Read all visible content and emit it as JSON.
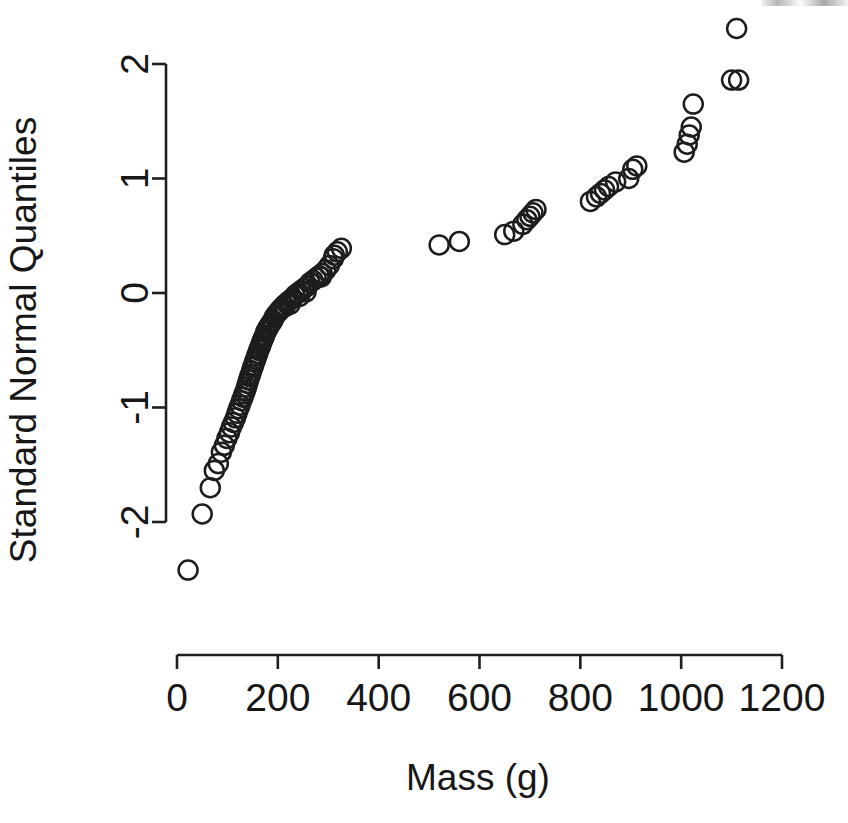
{
  "figure": {
    "width": 848,
    "height": 823,
    "background": "#ffffff",
    "foreground": "#1a1a1a"
  },
  "axis_labels": {
    "x_title": "Mass (g)",
    "y_title": "Standard Normal Quantiles"
  },
  "geometry": {
    "x_pixel_at_zero": 177,
    "x_pixel_at_max": 782,
    "y_pixel_at_two": 64,
    "y_pixel_at_minus_two": 522,
    "x_axis_line_y": 655,
    "y_axis_line_x": 166,
    "tick_length": 14,
    "marker_radius": 9.5
  },
  "chart_data": {
    "type": "scatter",
    "title": "",
    "xlabel": "Mass (g)",
    "ylabel": "Standard Normal Quantiles",
    "xlim": [
      -40,
      1210
    ],
    "ylim": [
      -2.55,
      2.45
    ],
    "xticks": [
      0,
      200,
      400,
      600,
      800,
      1000,
      1200
    ],
    "xticklabels": [
      "0",
      "200",
      "400",
      "600",
      "800",
      "1000",
      "1200"
    ],
    "yticks": [
      -2,
      -1,
      0,
      1,
      2
    ],
    "yticklabels": [
      "-2",
      "-1",
      "0",
      "1",
      "2"
    ],
    "grid": false,
    "legend": null,
    "marker": "open-circle",
    "n_points": 101,
    "x": [
      22,
      50,
      66,
      74,
      82,
      88,
      94,
      99,
      104,
      108,
      112,
      116,
      119,
      122,
      125,
      128,
      131,
      133,
      136,
      138,
      140,
      142,
      144,
      146,
      148,
      150,
      152,
      154,
      156,
      158,
      160,
      162,
      164,
      166,
      168,
      170,
      172,
      174,
      176,
      179,
      181,
      184,
      187,
      190,
      193,
      196,
      200,
      204,
      208,
      212,
      217,
      222,
      228,
      234,
      240,
      246,
      252,
      258,
      264,
      270,
      276,
      282,
      288,
      295,
      302,
      310,
      318,
      326,
      520,
      560,
      650,
      668,
      686,
      694,
      700,
      706,
      712,
      820,
      832,
      840,
      848,
      856,
      870,
      896,
      904,
      912,
      1006,
      1012,
      1016,
      1020,
      1024,
      1100,
      1110,
      1114,
      206,
      214,
      224,
      243,
      256,
      286,
      312
    ],
    "y": [
      -2.42,
      -1.93,
      -1.7,
      -1.55,
      -1.49,
      -1.39,
      -1.33,
      -1.27,
      -1.22,
      -1.17,
      -1.13,
      -1.09,
      -1.05,
      -1.01,
      -0.98,
      -0.94,
      -0.91,
      -0.88,
      -0.85,
      -0.82,
      -0.79,
      -0.76,
      -0.73,
      -0.71,
      -0.68,
      -0.65,
      -0.63,
      -0.6,
      -0.58,
      -0.55,
      -0.53,
      -0.5,
      -0.48,
      -0.46,
      -0.43,
      -0.41,
      -0.39,
      -0.37,
      -0.34,
      -0.32,
      -0.3,
      -0.28,
      -0.26,
      -0.24,
      -0.21,
      -0.19,
      -0.17,
      -0.15,
      -0.13,
      -0.11,
      -0.09,
      -0.07,
      -0.05,
      -0.02,
      0.0,
      0.02,
      0.04,
      0.06,
      0.09,
      0.11,
      0.13,
      0.15,
      0.17,
      0.2,
      0.24,
      0.3,
      0.36,
      0.39,
      0.42,
      0.45,
      0.51,
      0.54,
      0.6,
      0.64,
      0.67,
      0.7,
      0.73,
      0.8,
      0.84,
      0.87,
      0.9,
      0.93,
      0.97,
      1.0,
      1.08,
      1.11,
      1.23,
      1.3,
      1.38,
      1.45,
      1.65,
      1.86,
      2.31,
      1.86,
      -0.14,
      -0.12,
      -0.1,
      -0.03,
      0.01,
      0.14,
      0.33
    ]
  }
}
